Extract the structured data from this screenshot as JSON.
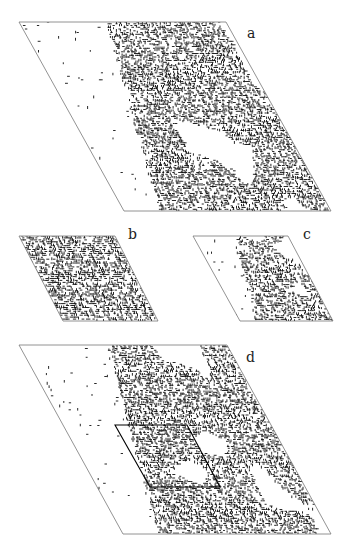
{
  "figure": {
    "panels": [
      {
        "id": "a",
        "label": "a",
        "description": "large rhombic lattice with spanning percolation cluster",
        "rhombus": [
          [
            19,
            22
          ],
          [
            226,
            22
          ],
          [
            331,
            211
          ],
          [
            124,
            211
          ]
        ],
        "label_pos": [
          247,
          38
        ],
        "density": 0.55,
        "fill_region": "right"
      },
      {
        "id": "b",
        "label": "b",
        "description": "small rhombic lattice densely filled",
        "rhombus": [
          [
            19,
            236
          ],
          [
            115,
            236
          ],
          [
            158,
            321
          ],
          [
            63,
            321
          ]
        ],
        "label_pos": [
          128,
          239
        ],
        "density": 0.62,
        "fill_region": "all"
      },
      {
        "id": "c",
        "label": "c",
        "description": "small rhombic lattice with cluster",
        "rhombus": [
          [
            193,
            236
          ],
          [
            288,
            236
          ],
          [
            333,
            321
          ],
          [
            240,
            321
          ]
        ],
        "label_pos": [
          303,
          239
        ],
        "density": 0.5,
        "fill_region": "right"
      },
      {
        "id": "d",
        "label": "d",
        "description": "large rhombic lattice with cluster and inner rhombus outline",
        "rhombus": [
          [
            19,
            345
          ],
          [
            227,
            345
          ],
          [
            331,
            534
          ],
          [
            123,
            534
          ]
        ],
        "label_pos": [
          246,
          362
        ],
        "density": 0.55,
        "fill_region": "right",
        "inner_rhombus": [
          [
            115,
            425
          ],
          [
            187,
            425
          ],
          [
            220,
            487
          ],
          [
            150,
            487
          ]
        ]
      }
    ],
    "colors": {
      "outline": "#777777",
      "cluster": "#111111",
      "inner_outline": "#000000"
    }
  }
}
